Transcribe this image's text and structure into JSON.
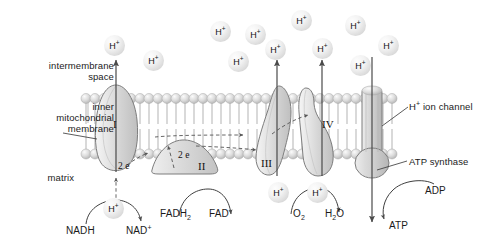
{
  "diagram": {
    "type": "biology-diagram"
  },
  "region_labels": {
    "intermembrane_space_line1": "intermembrane",
    "intermembrane_space_line2": "space",
    "inner_membrane_line1": "inner",
    "inner_membrane_line2": "mitochondrial",
    "inner_membrane_line3": "membrane",
    "matrix": "matrix"
  },
  "right_labels": {
    "ion_channel_h": "H",
    "ion_channel_sup": "+",
    "ion_channel_rest": " ion channel",
    "atp_synthase": "ATP synthase"
  },
  "complexes": [
    {
      "name": "complex-i",
      "label": "I"
    },
    {
      "name": "complex-ii",
      "label": "II"
    },
    {
      "name": "complex-iii",
      "label": "III"
    },
    {
      "name": "complex-iv",
      "label": "IV"
    }
  ],
  "electron_labels": [
    {
      "name": "electrons-complex-i",
      "text": "2 e"
    },
    {
      "name": "electrons-complex-ii",
      "text": "2 e"
    }
  ],
  "proton_ions": {
    "glyph_h": "H",
    "glyph_charge": "+",
    "intermembrane": [
      {
        "x": 104,
        "y": 35
      },
      {
        "x": 143,
        "y": 50
      },
      {
        "x": 210,
        "y": 21
      },
      {
        "x": 245,
        "y": 24
      },
      {
        "x": 228,
        "y": 51
      },
      {
        "x": 291,
        "y": 10
      },
      {
        "x": 265,
        "y": 39
      },
      {
        "x": 312,
        "y": 38
      },
      {
        "x": 345,
        "y": 15
      },
      {
        "x": 350,
        "y": 55
      },
      {
        "x": 378,
        "y": 35
      }
    ],
    "matrix": [
      {
        "x": 103,
        "y": 198
      },
      {
        "x": 268,
        "y": 182
      },
      {
        "x": 307,
        "y": 182
      }
    ]
  },
  "reactions": {
    "nadh": "NADH",
    "nad_plus_base": "NAD",
    "nad_plus_sup": "+",
    "fadh2_base": "FADH",
    "fadh2_sub": "2",
    "fad": "FAD",
    "o2_base": "O",
    "o2_sub": "2",
    "h2o_h": "H",
    "h2o_sub": "2",
    "h2o_o": "O",
    "adp": "ADP",
    "atp": "ATP"
  },
  "colors": {
    "protein_fill": "#d9d9d9",
    "protein_stroke": "#6f6f6f",
    "membrane_head": "#d2d2d2",
    "membrane_tail": "#cccccc",
    "arrow": "#4a4a4a",
    "text": "#1a1a1a",
    "background": "#ffffff"
  }
}
